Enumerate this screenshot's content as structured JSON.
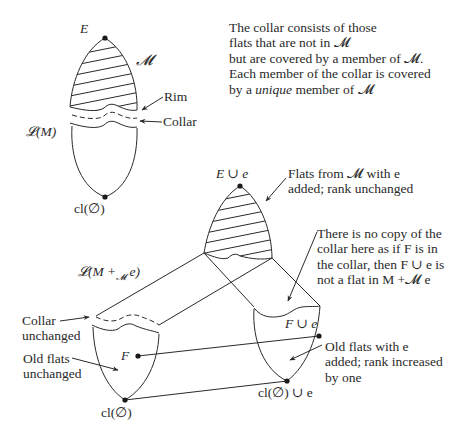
{
  "diagram": {
    "top_diagram": {
      "top_label": "E",
      "modular_cut_label": "𝓜",
      "lattice_label": "𝓛(M)",
      "bottom_label": "cl(∅)",
      "rim_label": "Rim",
      "collar_label": "Collar"
    },
    "explanation": {
      "lines": [
        "The collar consists of those",
        "flats that are not in 𝓜",
        "but are covered by a member of 𝓜.",
        "Each member of the collar is covered"
      ],
      "last_line_prefix": "by a ",
      "last_line_emphasis": "unique",
      "last_line_suffix": " member of 𝓜"
    },
    "bottom_diagram": {
      "top_label": "E ∪ e",
      "lattice_label": "𝓛(M +",
      "lattice_label_sub": "𝓜",
      "lattice_label_end": " e)",
      "flats_from_m_note": [
        "Flats from 𝓜 with e",
        "added; rank unchanged"
      ],
      "no_copy_note": [
        "There is no copy of the",
        "collar here as if F is in",
        "the collar, then F ∪ e is",
        "not a flat in M +𝓜 e"
      ],
      "collar_unchanged_note": [
        "Collar",
        "unchanged"
      ],
      "old_flats_unchanged_note": [
        "Old flats",
        "unchanged"
      ],
      "old_flats_with_e_note": [
        "Old flats with e",
        "added; rank increased",
        "by one"
      ],
      "flat_label": "F",
      "flat_plus_e_label": "F ∪ e",
      "bottom_left_label": "cl(∅)",
      "bottom_right_label": "cl(∅) ∪ e"
    },
    "colors": {
      "ink": "#2a2a2a",
      "background": "#ffffff"
    }
  }
}
